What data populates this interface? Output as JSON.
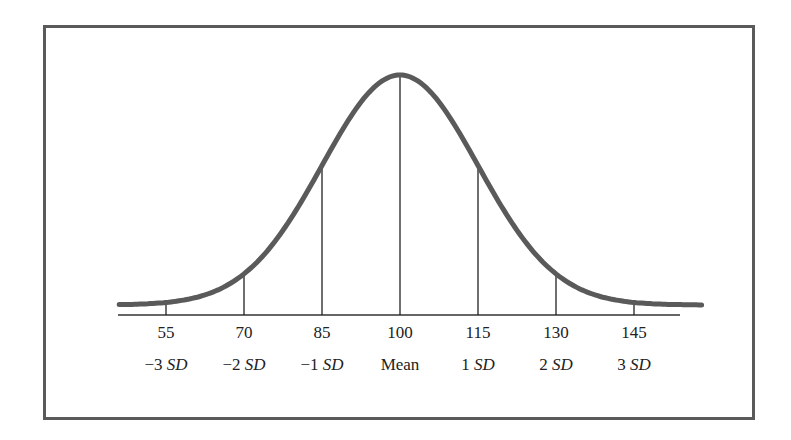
{
  "chart_data": {
    "type": "line",
    "title": "",
    "mean": 100,
    "sd": 15,
    "x_ticks": [
      55,
      70,
      85,
      100,
      115,
      130,
      145
    ],
    "tick_labels_top": [
      "55",
      "70",
      "85",
      "100",
      "115",
      "130",
      "145"
    ],
    "tick_labels_bottom": [
      {
        "num": "−3",
        "unit": "SD"
      },
      {
        "num": "−2",
        "unit": "SD"
      },
      {
        "num": "−1",
        "unit": "SD"
      },
      {
        "num": "",
        "unit": "Mean"
      },
      {
        "num": "1",
        "unit": "SD"
      },
      {
        "num": "2",
        "unit": "SD"
      },
      {
        "num": "3",
        "unit": "SD"
      }
    ],
    "xlim": [
      46,
      158
    ],
    "xlabel": "",
    "ylabel": "",
    "grid": false,
    "legend": null,
    "colors": {
      "curve": "#5a5a5a",
      "frame": "#5a5a5a",
      "lines": "#222222"
    }
  }
}
